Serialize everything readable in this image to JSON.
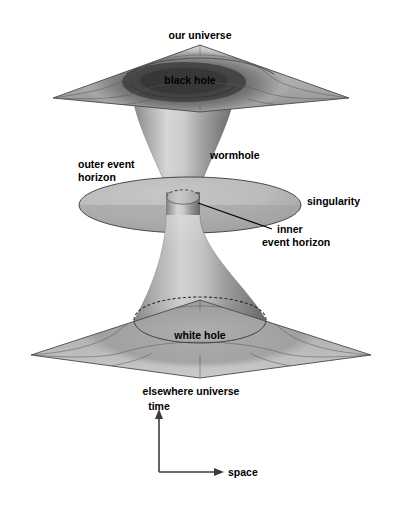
{
  "figure": {
    "background_color": "#ffffff",
    "width": 395,
    "height": 519
  },
  "labels": {
    "our_universe": "our universe",
    "black_hole": "black hole",
    "outer_event_horizon_line1": "outer event",
    "outer_event_horizon_line2": "horizon",
    "wormhole": "wormhole",
    "singularity": "singularity",
    "inner_line1": "inner",
    "inner_line2": "event horizon",
    "white_hole": "white hole",
    "elsewhere_universe": "elsewhere universe",
    "time_axis": "time",
    "space_axis": "space"
  },
  "colors": {
    "ink": "#000000",
    "axis": "#3b3b3b",
    "plane_light": "#cfcfcf",
    "plane_mid": "#a8a8a8",
    "plane_dark": "#6b6b6b",
    "funnel_light": "#d8d8d8",
    "funnel_mid": "#9a9a9a",
    "funnel_dark": "#5a5a5a",
    "disk_light": "#c8c8c8",
    "disk_dark": "#8c8c8c",
    "background": "#ffffff"
  },
  "geometry": {
    "top_plane": {
      "left": [
        53,
        98
      ],
      "top": [
        200,
        45
      ],
      "right": [
        349,
        98
      ],
      "bottom": [
        200,
        112
      ],
      "label": "our universe sheet"
    },
    "bottom_plane": {
      "left": [
        31,
        355
      ],
      "top": [
        200,
        300
      ],
      "right": [
        371,
        355
      ],
      "bottom": [
        200,
        378
      ],
      "label": "elsewhere universe sheet"
    },
    "singularity_disk": {
      "center": [
        190,
        205
      ],
      "rx": 111,
      "ry": 28
    },
    "inner_event_horizon": {
      "center": [
        183,
        197
      ],
      "rx": 16,
      "ry": 7
    },
    "throat": {
      "center_x": 183,
      "narrowest_y": 205,
      "narrowest_half_width": 17,
      "top_half_width": 52,
      "bottom_half_width": 62
    },
    "time_axis": {
      "x": 159,
      "y_from": 472,
      "y_to": 412
    },
    "space_axis": {
      "y": 472,
      "x_from": 159,
      "x_to": 222
    },
    "leader_line": {
      "from": [
        198,
        204
      ],
      "to": [
        272,
        229
      ]
    }
  }
}
